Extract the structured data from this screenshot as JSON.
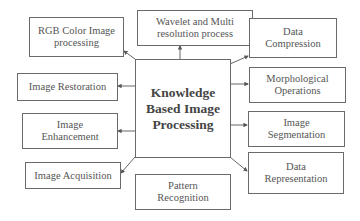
{
  "diagram": {
    "center": {
      "label": "Knowledge\nBased Image\nProcessing"
    },
    "nodes": [
      {
        "id": "rgb",
        "label": "RGB Color Image\nprocessing"
      },
      {
        "id": "wave",
        "label": "Wavelet and Multi\nresolution process"
      },
      {
        "id": "comp",
        "label": "Data\nCompression"
      },
      {
        "id": "rest",
        "label": "Image Restoration"
      },
      {
        "id": "morph",
        "label": "Morphological\nOperations"
      },
      {
        "id": "enh",
        "label": "Image\nEnhancement"
      },
      {
        "id": "seg",
        "label": "Image\nSegmentation"
      },
      {
        "id": "acq",
        "label": "Image Acquisition"
      },
      {
        "id": "rep",
        "label": "Data\nRepresentation"
      },
      {
        "id": "pat",
        "label": "Pattern\nRecognition"
      }
    ],
    "edges": [
      {
        "from": "center",
        "to": "rgb"
      },
      {
        "from": "center",
        "to": "wave"
      },
      {
        "from": "center",
        "to": "comp"
      },
      {
        "from": "center",
        "to": "rest"
      },
      {
        "from": "center",
        "to": "morph"
      },
      {
        "from": "center",
        "to": "enh"
      },
      {
        "from": "center",
        "to": "seg"
      },
      {
        "from": "center",
        "to": "acq"
      },
      {
        "from": "center",
        "to": "rep"
      }
    ],
    "colors": {
      "border": "#6a6a6a",
      "text": "#555555",
      "line": "#555555"
    }
  }
}
